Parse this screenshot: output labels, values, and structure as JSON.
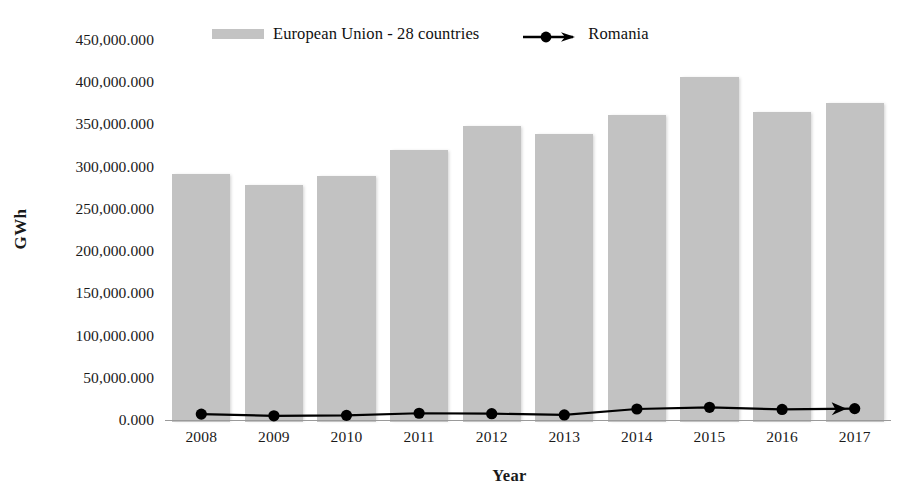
{
  "chart_data": {
    "type": "bar",
    "title": "",
    "xlabel": "Year",
    "ylabel": "GWh",
    "categories": [
      "2008",
      "2009",
      "2010",
      "2011",
      "2012",
      "2013",
      "2014",
      "2015",
      "2016",
      "2017"
    ],
    "ylim": [
      0,
      450000
    ],
    "ytick_values": [
      0,
      50000,
      100000,
      150000,
      200000,
      250000,
      300000,
      350000,
      400000,
      450000
    ],
    "ytick_labels": [
      "0.000",
      "50,000.000",
      "100,000.000",
      "150,000.000",
      "200,000.000",
      "250,000.000",
      "300,000.000",
      "350,000.000",
      "400,000.000",
      "450,000.000"
    ],
    "grid": false,
    "legend_position": "top-center",
    "series": [
      {
        "name": "European Union - 28 countries",
        "type": "bar",
        "color": "#c2c2c2",
        "values": [
          294000,
          281000,
          291000,
          322000,
          350000,
          341000,
          364000,
          408000,
          367000,
          378000
        ]
      },
      {
        "name": "Romania",
        "type": "line",
        "color": "#000000",
        "marker": "circle",
        "arrow_end": true,
        "values": [
          7000,
          5000,
          5500,
          8000,
          7500,
          6000,
          13000,
          15000,
          12500,
          13500
        ]
      }
    ]
  },
  "legend": {
    "entries": [
      {
        "label": "European Union - 28 countries",
        "swatch": "bar-swatch"
      },
      {
        "label": "Romania",
        "swatch": "line-marker-arrow-swatch"
      }
    ]
  },
  "axes": {
    "y_title": "GWh",
    "x_title": "Year"
  }
}
